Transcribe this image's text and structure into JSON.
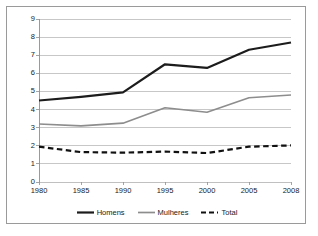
{
  "chart_data": {
    "type": "line",
    "title": "",
    "subtitle": "",
    "xlabel": "",
    "ylabel": "",
    "x": [
      1980,
      1985,
      1990,
      1995,
      2000,
      2005,
      2008
    ],
    "categories": [
      "1980",
      "1985",
      "1990",
      "1995",
      "2000",
      "2005",
      "2008"
    ],
    "xlim": [
      1980,
      2008
    ],
    "ylim": [
      0,
      9
    ],
    "y_ticks": [
      0,
      1,
      2,
      3,
      4,
      5,
      6,
      7,
      8,
      9
    ],
    "y_tick_labels": [
      "0",
      "1",
      "2",
      "3",
      "4",
      "5",
      "6",
      "7",
      "8",
      "9"
    ],
    "grid": "horizontal",
    "legend_position": "bottom",
    "series": [
      {
        "name": "Homens",
        "values": [
          4.5,
          4.7,
          4.95,
          6.5,
          6.3,
          7.3,
          7.7
        ],
        "color": "#1c1c1c",
        "style": "solid",
        "width": 2.2
      },
      {
        "name": "Mulheres",
        "values": [
          3.2,
          3.1,
          3.25,
          4.1,
          3.85,
          4.65,
          4.8
        ],
        "color": "#8d8d8d",
        "style": "solid",
        "width": 1.6
      },
      {
        "name": "Total",
        "values": [
          1.95,
          1.65,
          1.62,
          1.68,
          1.6,
          1.95,
          2.02
        ],
        "color": "#111111",
        "style": "dashed",
        "width": 2.2
      }
    ]
  },
  "frame": {
    "border_color": "#9a9a9a",
    "background": "#ffffff",
    "gridline_color": "#b9b9b9",
    "axis_color": "#8f8f8f"
  },
  "legend": {
    "entries": [
      {
        "label": "Homens",
        "color": "#1c1c1c",
        "style": "solid"
      },
      {
        "label": "Mulheres",
        "color": "#8d8d8d",
        "style": "solid"
      },
      {
        "label": "Total",
        "color": "#111111",
        "style": "dashed"
      }
    ]
  }
}
